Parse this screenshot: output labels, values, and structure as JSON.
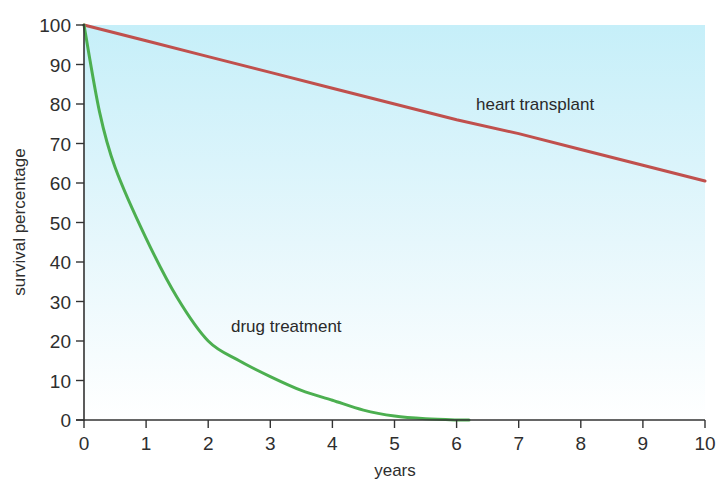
{
  "chart_data": {
    "type": "line",
    "title": "",
    "xlabel": "years",
    "ylabel": "survival percentage",
    "xlim": [
      0,
      10
    ],
    "ylim": [
      0,
      100
    ],
    "x_ticks": [
      0,
      1,
      2,
      3,
      4,
      5,
      6,
      7,
      8,
      9,
      10
    ],
    "y_ticks": [
      0,
      10,
      20,
      30,
      40,
      50,
      60,
      70,
      80,
      90,
      100
    ],
    "grid": false,
    "legend": "inline labels",
    "background": "vertical gradient light cyan to white",
    "series": [
      {
        "name": "heart transplant",
        "color": "#c0504d",
        "x": [
          0,
          1,
          2,
          3,
          4,
          5,
          6,
          7,
          8,
          9,
          10
        ],
        "values": [
          100,
          96,
          92,
          88,
          84,
          80,
          76,
          72.5,
          68.5,
          64.5,
          60.5
        ],
        "label_position": {
          "x": 6.4,
          "y": 80
        }
      },
      {
        "name": "drug treatment",
        "color": "#4caf50",
        "x": [
          0,
          0.25,
          0.5,
          1,
          1.5,
          2,
          2.5,
          3,
          3.5,
          4,
          4.5,
          5,
          5.5,
          6,
          6.2
        ],
        "values": [
          100,
          78,
          64,
          46,
          31,
          20,
          15,
          11,
          7.5,
          5,
          2.5,
          1,
          0.3,
          0,
          0
        ],
        "label_position": {
          "x": 2.4,
          "y": 24
        }
      }
    ]
  },
  "axes": {
    "x_title": "years",
    "y_title": "survival percentage",
    "x_tick_labels": [
      "0",
      "1",
      "2",
      "3",
      "4",
      "5",
      "6",
      "7",
      "8",
      "9",
      "10"
    ],
    "y_tick_labels": [
      "0",
      "10",
      "20",
      "30",
      "40",
      "50",
      "60",
      "70",
      "80",
      "90",
      "100"
    ]
  },
  "labels": {
    "heart": "heart transplant",
    "drug": "drug treatment"
  },
  "colors": {
    "bg_top": "#c8f0fa",
    "bg_bottom": "#ffffff",
    "axis": "#333333"
  }
}
